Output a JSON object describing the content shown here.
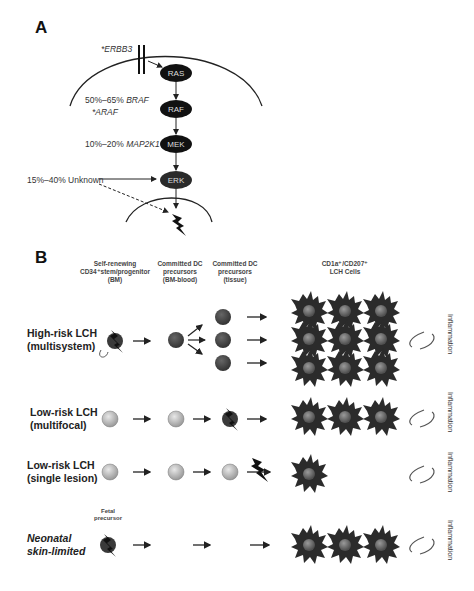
{
  "panel_a": {
    "label": "A",
    "nodes": [
      "RAS",
      "RAF",
      "MEK",
      "ERK"
    ],
    "annotations": {
      "erbb3": "*ERBB3",
      "braf_pct": "50%–65% ",
      "braf_gene": "BRAF",
      "araf": "*ARAF",
      "map2k1_pct": "10%–20% ",
      "map2k1_gene": "MAP2K1",
      "unknown": "15%–40% Unknown"
    }
  },
  "panel_b": {
    "label": "B",
    "columns": [
      {
        "line1": "Self-renewing",
        "line2": "CD34⁺stem/progenitor",
        "line3": "(BM)"
      },
      {
        "line1": "Committed DC",
        "line2": "precursors",
        "line3": "(BM-blood)"
      },
      {
        "line1": "Committed DC",
        "line2": "precursors",
        "line3": "(tissue)"
      },
      {
        "line1": "CD1a⁺/CD207⁺",
        "line2": "LCH Cells",
        "line3": ""
      }
    ],
    "rows": [
      {
        "line1": "High-risk LCH",
        "line2": "(multisystem)",
        "side_label": "Inflammation"
      },
      {
        "line1": "Low-risk LCH",
        "line2": "(multifocal)",
        "side_label": "Inflammation"
      },
      {
        "line1": "Low-risk LCH",
        "line2": "(single lesion)",
        "side_label": "Inflammation"
      },
      {
        "line1": "Neonatal",
        "line2": "skin-limited",
        "side_label": "Inflammation"
      }
    ],
    "fetal_label": {
      "line1": "Fetal",
      "line2": "precursor"
    }
  },
  "colors": {
    "node_fill": "#111111",
    "cell_dark": "#2b2b2b",
    "cell_nucleus": "#6e6e6e",
    "precursor_dark": "#444444",
    "precursor_light": "#bdbdbd"
  }
}
